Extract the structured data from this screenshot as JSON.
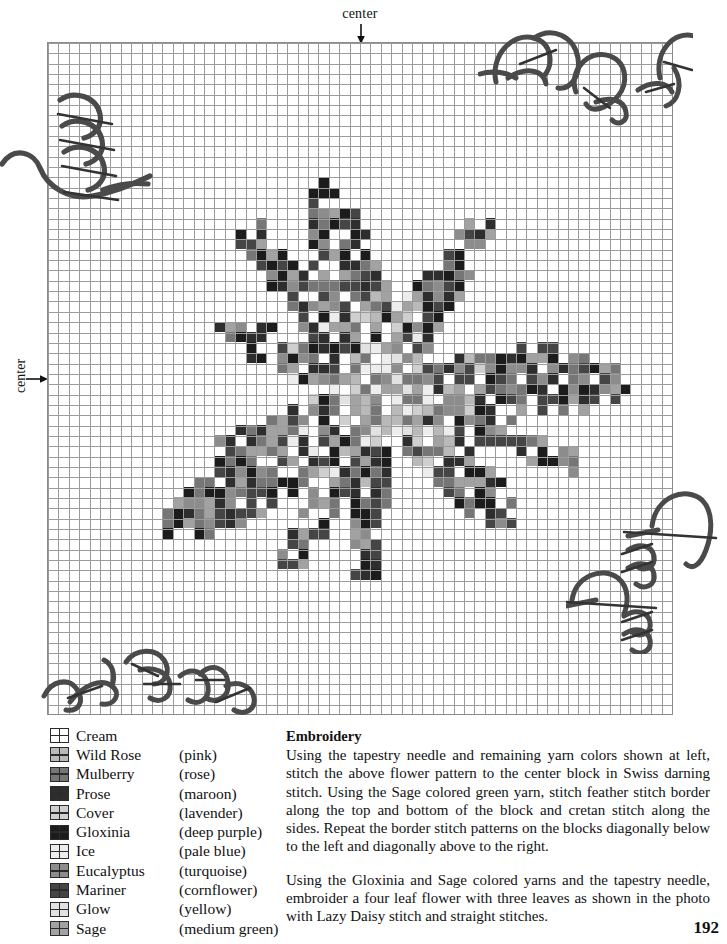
{
  "chart_data": {
    "type": "heatmap",
    "grid": {
      "columns": 60,
      "rows": 65,
      "bold_every": 5,
      "grid": true
    },
    "axis_labels": {
      "top": "center",
      "left": "center"
    },
    "palette": {
      "Cream": "#ffffff",
      "Wild Rose": "#b9b9b9",
      "Mulberry": "#767676",
      "Prose": "#2e2e2e",
      "Cover": "#cfcfcf",
      "Gloxinia": "#1c1c1c",
      "Ice": "#ededed",
      "Eucalyptus": "#8c8c8c",
      "Mariner": "#454545",
      "Glow": "#e2e2e2",
      "Sage": "#a2a2a2"
    },
    "legend_position": "bottom-left"
  },
  "chart_header": {
    "center_top": "center",
    "center_left": "center"
  },
  "legend": {
    "items": [
      {
        "name": "Cream",
        "desc": "",
        "color": "#ffffff"
      },
      {
        "name": "Wild Rose",
        "desc": "(pink)",
        "color": "#b9b9b9"
      },
      {
        "name": "Mulberry",
        "desc": "(rose)",
        "color": "#767676"
      },
      {
        "name": "Prose",
        "desc": "(maroon)",
        "color": "#2e2e2e"
      },
      {
        "name": "Cover",
        "desc": "(lavender)",
        "color": "#cfcfcf"
      },
      {
        "name": "Gloxinia",
        "desc": "(deep purple)",
        "color": "#1c1c1c"
      },
      {
        "name": "Ice",
        "desc": "(pale blue)",
        "color": "#ededed"
      },
      {
        "name": "Eucalyptus",
        "desc": "(turquoise)",
        "color": "#8c8c8c"
      },
      {
        "name": "Mariner",
        "desc": "(cornflower)",
        "color": "#454545"
      },
      {
        "name": "Glow",
        "desc": "(yellow)",
        "color": "#e2e2e2"
      },
      {
        "name": "Sage",
        "desc": "(medium green)",
        "color": "#a2a2a2"
      }
    ]
  },
  "instructions": {
    "heading": "Embroidery",
    "paragraph1": "Using the tapestry needle and remaining yarn colors shown at left, stitch the above flower pattern to the center block in Swiss darning stitch. Using the Sage colored green yarn, stitch feather stitch border along the top and bottom of the block and cretan stitch along the sides. Repeat the border stitch patterns on the blocks diagonally below to the left and diagonally above to the right.",
    "paragraph2": "Using the Gloxinia and Sage colored yarns and the tapestry needle, embroider a four leaf flower with three leaves as shown in the photo with Lazy Daisy stitch and straight stitches."
  },
  "page": {
    "number": "192"
  }
}
